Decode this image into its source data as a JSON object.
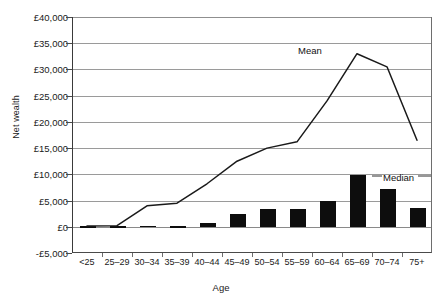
{
  "chart_data": {
    "type": "bar",
    "title": "",
    "xlabel": "Age",
    "ylabel": "Net wealth",
    "categories": [
      "<25",
      "25–29",
      "30–34",
      "35–39",
      "40–44",
      "45–49",
      "50–54",
      "55–59",
      "60–64",
      "65–69",
      "70–74",
      "75+"
    ],
    "ylim": [
      -5000,
      40000
    ],
    "ytick_step": 5000,
    "ytick_labels": [
      "£40,000",
      "£35,000",
      "£30,000",
      "£25,000",
      "£20,000",
      "£15,000",
      "£10,000",
      "£5,000",
      "£0",
      "-£5,000"
    ],
    "ytick_values": [
      40000,
      35000,
      30000,
      25000,
      20000,
      15000,
      10000,
      5000,
      0,
      -5000
    ],
    "grid": true,
    "legend_position": "inline-annotations",
    "series": [
      {
        "name": "Median",
        "type": "bar",
        "color": "#0d0d0d",
        "values": [
          100,
          150,
          200,
          150,
          800,
          2400,
          3400,
          3300,
          5000,
          9800,
          7200,
          3500
        ]
      },
      {
        "name": "Mean",
        "type": "line",
        "color": "#1a1a1a",
        "values": [
          150,
          200,
          4000,
          4500,
          8200,
          12500,
          15000,
          16200,
          24000,
          33000,
          30500,
          16500
        ]
      }
    ],
    "annotations": [
      {
        "name": "mean-label",
        "text": "Mean"
      },
      {
        "name": "median-label",
        "text": "Median"
      }
    ]
  },
  "axes": {
    "y_title": "Net wealth",
    "x_title": "Age"
  }
}
